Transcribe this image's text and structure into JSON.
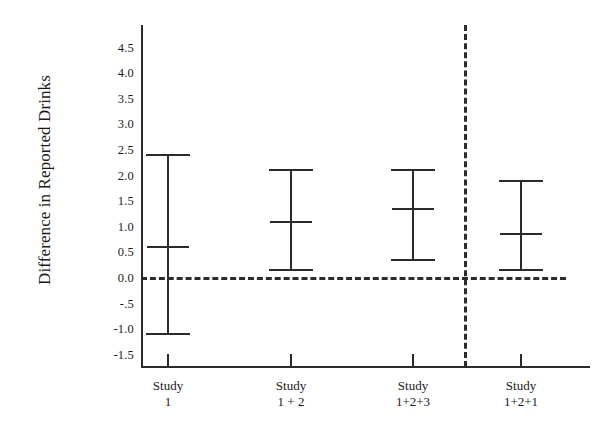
{
  "chart_data": {
    "type": "scatter",
    "title": "",
    "subtitle": "",
    "xlabel": "",
    "ylabel": "Difference in Reported Drinks",
    "ylim": [
      -1.75,
      4.75
    ],
    "grid": false,
    "legend": "none",
    "y_ticks": [
      "4.5",
      "4.0",
      "3.5",
      "3.0",
      "2.5",
      "2.0",
      "1.5",
      "1.0",
      "0.5",
      "0.0",
      "-.5",
      "-1.0",
      "-1.5"
    ],
    "y_tick_values": [
      4.5,
      4.0,
      3.5,
      3.0,
      2.5,
      2.0,
      1.5,
      1.0,
      0.5,
      0.0,
      -0.5,
      -1.0,
      -1.5
    ],
    "categories": [
      "Study 1",
      "Study 1 + 2",
      "Study 1+2+3",
      "Study 1+2+1"
    ],
    "category_lines": [
      {
        "line1": "Study",
        "line2": "1"
      },
      {
        "line1": "Study",
        "line2": "1 + 2"
      },
      {
        "line1": "Study",
        "line2": "1+2+3"
      },
      {
        "line1": "Study",
        "line2": "1+2+1"
      }
    ],
    "series": [
      {
        "name": "Difference in Reported Drinks",
        "estimates": [
          0.6,
          1.1,
          1.35,
          0.85
        ],
        "ci_lower": [
          -1.1,
          0.15,
          0.35,
          0.15
        ],
        "ci_upper": [
          2.4,
          2.1,
          2.1,
          1.9
        ]
      }
    ],
    "points": [
      {
        "category": "Study 1",
        "estimate": 0.6,
        "ci_lower": -1.1,
        "ci_upper": 2.4
      },
      {
        "category": "Study 1 + 2",
        "estimate": 1.1,
        "ci_lower": 0.15,
        "ci_upper": 2.1
      },
      {
        "category": "Study 1+2+3",
        "estimate": 1.35,
        "ci_lower": 0.35,
        "ci_upper": 2.1
      },
      {
        "category": "Study 1+2+1",
        "estimate": 0.85,
        "ci_lower": 0.15,
        "ci_upper": 1.9
      }
    ],
    "annotations": [
      {
        "name": "zero-reference-line",
        "style": "dashed",
        "y": 0.0
      },
      {
        "name": "vertical-separator",
        "style": "dashed",
        "after_category": "Study 1+2+3"
      }
    ],
    "colors": {
      "ink": "#2b2b2b",
      "background": "#ffffff"
    }
  }
}
